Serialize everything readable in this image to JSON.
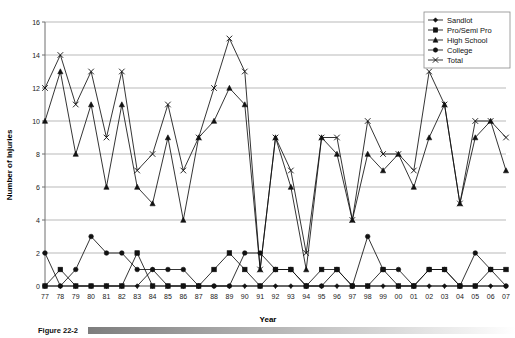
{
  "figure": {
    "caption_label": "Figure 22-2",
    "background": "#ffffff"
  },
  "chart_data": {
    "type": "line",
    "title": "",
    "xlabel": "Year",
    "ylabel": "Number of Injuries",
    "categories": [
      "77",
      "78",
      "79",
      "80",
      "81",
      "82",
      "83",
      "84",
      "85",
      "86",
      "87",
      "88",
      "89",
      "90",
      "91",
      "92",
      "93",
      "94",
      "95",
      "96",
      "97",
      "98",
      "99",
      "00",
      "01",
      "02",
      "03",
      "04",
      "05",
      "06",
      "07"
    ],
    "x": [
      "77",
      "78",
      "79",
      "80",
      "81",
      "82",
      "83",
      "84",
      "85",
      "86",
      "87",
      "88",
      "89",
      "90",
      "91",
      "92",
      "93",
      "94",
      "95",
      "96",
      "97",
      "98",
      "99",
      "00",
      "01",
      "02",
      "03",
      "04",
      "05",
      "06",
      "07"
    ],
    "xlim": [
      0,
      30
    ],
    "ylim": [
      0,
      16
    ],
    "ytick_values": [
      0,
      2,
      4,
      6,
      8,
      10,
      12,
      14,
      16
    ],
    "grid": true,
    "legend_position": "top-right",
    "series": [
      {
        "name": "Sandlot",
        "marker": "diamond",
        "color": "#111111",
        "values": [
          0,
          0,
          0,
          0,
          0,
          0,
          0,
          1,
          0,
          0,
          0,
          0,
          0,
          0,
          0,
          0,
          0,
          0,
          0,
          0,
          0,
          0,
          0,
          0,
          0,
          0,
          0,
          0,
          0,
          0,
          0
        ]
      },
      {
        "name": "Pro/Semi Pro",
        "marker": "square",
        "color": "#111111",
        "values": [
          0,
          1,
          0,
          0,
          0,
          0,
          2,
          0,
          0,
          0,
          0,
          1,
          2,
          1,
          0,
          1,
          1,
          0,
          1,
          1,
          0,
          0,
          1,
          0,
          0,
          1,
          1,
          0,
          0,
          1,
          1
        ]
      },
      {
        "name": "High School",
        "marker": "triangle",
        "color": "#111111",
        "values": [
          10,
          13,
          8,
          11,
          6,
          11,
          6,
          5,
          9,
          4,
          9,
          10,
          12,
          11,
          1,
          9,
          6,
          1,
          9,
          8,
          4,
          8,
          7,
          8,
          6,
          9,
          11,
          5,
          9,
          10,
          7
        ]
      },
      {
        "name": "College",
        "marker": "circle",
        "color": "#111111",
        "values": [
          2,
          0,
          1,
          3,
          2,
          2,
          1,
          1,
          1,
          1,
          0,
          0,
          0,
          2,
          2,
          1,
          1,
          0,
          0,
          1,
          0,
          3,
          1,
          1,
          0,
          1,
          1,
          0,
          2,
          1,
          0
        ]
      },
      {
        "name": "Total",
        "marker": "x",
        "color": "#111111",
        "values": [
          12,
          14,
          11,
          13,
          9,
          13,
          7,
          8,
          11,
          7,
          9,
          12,
          15,
          13,
          1,
          9,
          7,
          2,
          9,
          9,
          4,
          10,
          8,
          8,
          7,
          13,
          11,
          5,
          10,
          10,
          9
        ]
      }
    ]
  }
}
